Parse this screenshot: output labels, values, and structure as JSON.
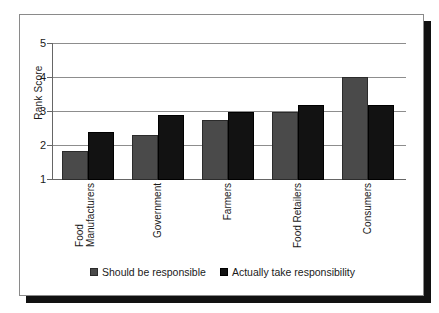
{
  "chart_data": {
    "type": "bar",
    "title": "",
    "xlabel": "",
    "ylabel": "Rank Score",
    "ylim": [
      1,
      5
    ],
    "yticks": [
      1,
      2,
      3,
      4,
      5
    ],
    "ytick_labels": [
      "1",
      "2",
      "3",
      "4",
      "5"
    ],
    "grid": "horizontal",
    "legend_position": "bottom",
    "categories": [
      "Food\nManufacturers",
      "Government",
      "Farmers",
      "Food Retailers",
      "Consumers"
    ],
    "series": [
      {
        "name": "Should be responsible",
        "color": "#4a4a4a",
        "values": [
          1.85,
          2.3,
          2.75,
          3.0,
          4.0
        ]
      },
      {
        "name": "Actually take responsibility",
        "color": "#121212",
        "values": [
          2.4,
          2.9,
          3.0,
          3.2,
          3.2
        ]
      }
    ]
  },
  "legend": {
    "items": [
      {
        "label": "Should be responsible"
      },
      {
        "label": "Actually take responsibility"
      }
    ]
  }
}
